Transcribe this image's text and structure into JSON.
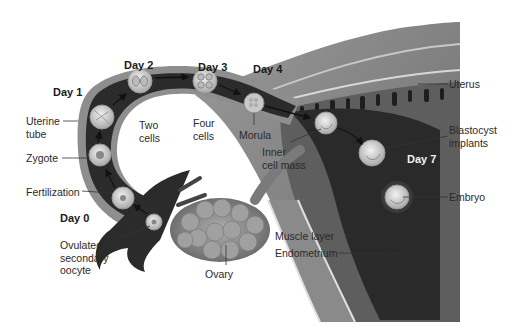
{
  "figure": {
    "colors": {
      "tube_dark": "#2b2b2b",
      "tube_wall": "#8a8a8a",
      "uterus_wall": "#7a7a7a",
      "endometrium": "#6e6e6e",
      "ovary": "#8c8c8c",
      "cell": "#d8d8d8",
      "label_text": "#2a2a2a"
    }
  },
  "days": [
    {
      "id": "day0",
      "label": "Day 0"
    },
    {
      "id": "day1",
      "label": "Day 1"
    },
    {
      "id": "day2",
      "label": "Day 2"
    },
    {
      "id": "day3",
      "label": "Day 3"
    },
    {
      "id": "day4",
      "label": "Day 4"
    },
    {
      "id": "day7",
      "label": "Day 7"
    }
  ],
  "labels": {
    "uterine_tube": [
      "Uterine",
      "tube"
    ],
    "zygote": "Zygote",
    "fertilization": "Fertilization",
    "ovulated_oocyte": [
      "Ovulated",
      "secondary",
      "oocyte"
    ],
    "two_cells": [
      "Two",
      "cells"
    ],
    "four_cells": [
      "Four",
      "cells"
    ],
    "morula": "Morula",
    "inner_cell_mass": [
      "Inner",
      "cell mass"
    ],
    "uterus": "Uterus",
    "blastocyst_implants": [
      "Blastocyst",
      "implants"
    ],
    "embryo": "Embryo",
    "muscle_layer": "Muscle layer",
    "endometrium": "Endometrium",
    "ovary": "Ovary"
  }
}
